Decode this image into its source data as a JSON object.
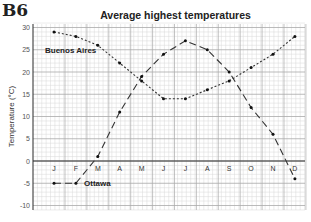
{
  "figure_label": "B6",
  "chart_data": {
    "type": "line",
    "title": "Average highest temperatures",
    "xlabel": "",
    "ylabel": "Temperature (°C)",
    "categories": [
      "J",
      "F",
      "M",
      "A",
      "M",
      "J",
      "J",
      "A",
      "S",
      "O",
      "N",
      "D"
    ],
    "series": [
      {
        "name": "Buenos Aires",
        "style": "dotted",
        "values": [
          29,
          28,
          26,
          22,
          18,
          14,
          14,
          16,
          18,
          21,
          24,
          28
        ]
      },
      {
        "name": "Ottawa",
        "style": "dashed",
        "values": [
          -5,
          -5,
          1,
          11,
          19,
          24,
          27,
          25,
          20,
          12,
          6,
          -4
        ]
      }
    ],
    "ylim": [
      -11,
      31
    ],
    "yticks": [
      -10,
      -5,
      0,
      5,
      10,
      15,
      20,
      25,
      30
    ],
    "grid": true,
    "legend": "inline annotations"
  }
}
